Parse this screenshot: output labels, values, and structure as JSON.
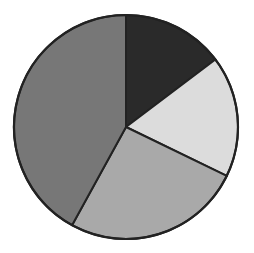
{
  "chart_data": {
    "type": "pie",
    "title": "",
    "start_angle_deg": 0,
    "direction": "clockwise",
    "legend": null,
    "slices": [
      {
        "label": "",
        "value": 14.7,
        "color": "#2a2a2a"
      },
      {
        "label": "",
        "value": 17.5,
        "color": "#dcdcdc"
      },
      {
        "label": "",
        "value": 25.8,
        "color": "#a9a9a9"
      },
      {
        "label": "",
        "value": 42.0,
        "color": "#777777"
      }
    ]
  },
  "style": {
    "center": [
      126,
      127
    ],
    "radius": 112,
    "stroke": "#222222"
  }
}
